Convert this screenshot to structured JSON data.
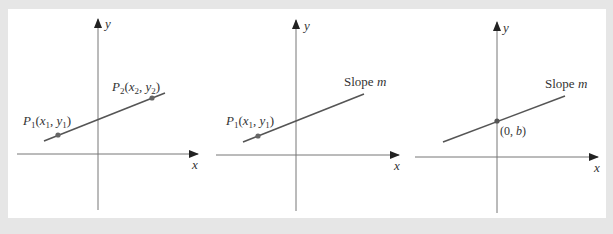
{
  "figure": {
    "background": "#e6e6e6",
    "panel_background": "#ffffff",
    "line_color": "#555555",
    "point_color": "#666666",
    "panels": [
      {
        "id": "two-point",
        "axis_x_label": "x",
        "axis_y_label": "y",
        "points": [
          {
            "label_main": "P",
            "label_sub": "1",
            "label_rest": "(x",
            "sub_x": "1",
            "comma": ", y",
            "sub_y": "1",
            "close": ")"
          },
          {
            "label_main": "P",
            "label_sub": "2",
            "label_rest": "(x",
            "sub_x": "2",
            "comma": ", y",
            "sub_y": "2",
            "close": ")"
          }
        ]
      },
      {
        "id": "point-slope",
        "axis_x_label": "x",
        "axis_y_label": "y",
        "slope_label": "Slope",
        "slope_var": "m",
        "points": [
          {
            "label_main": "P",
            "label_sub": "1",
            "label_rest": "(x",
            "sub_x": "1",
            "comma": ", y",
            "sub_y": "1",
            "close": ")"
          }
        ]
      },
      {
        "id": "slope-intercept",
        "axis_x_label": "x",
        "axis_y_label": "y",
        "slope_label": "Slope",
        "slope_var": "m",
        "intercept_label_open": "(0, ",
        "intercept_var": "b",
        "intercept_label_close": ")"
      }
    ]
  }
}
